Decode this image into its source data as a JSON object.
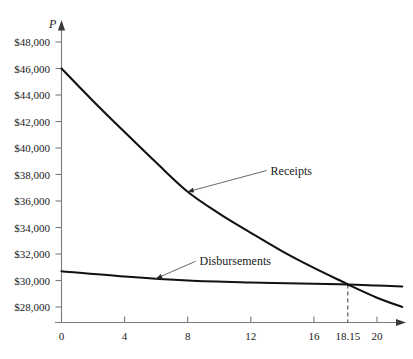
{
  "chart_data": {
    "type": "line",
    "title": "",
    "xlabel": "",
    "ylabel": "P",
    "ylabel_style": "italic",
    "xlim": [
      0,
      21.8
    ],
    "ylim": [
      27000,
      49000
    ],
    "grid": false,
    "legend": "inline-annotations",
    "x_ticks": [
      {
        "value": 0,
        "label": "0"
      },
      {
        "value": 4,
        "label": "4"
      },
      {
        "value": 8,
        "label": "8"
      },
      {
        "value": 12,
        "label": "12"
      },
      {
        "value": 16,
        "label": "16"
      },
      {
        "value": 18.15,
        "label": "18.15"
      },
      {
        "value": 20,
        "label": "20"
      }
    ],
    "y_ticks": [
      {
        "value": 48000,
        "label": "$48,000"
      },
      {
        "value": 46000,
        "label": "$46,000"
      },
      {
        "value": 44000,
        "label": "$44,000"
      },
      {
        "value": 42000,
        "label": "$42,000"
      },
      {
        "value": 40000,
        "label": "$40,000"
      },
      {
        "value": 38000,
        "label": "$38,000"
      },
      {
        "value": 36000,
        "label": "$36,000"
      },
      {
        "value": 34000,
        "label": "$34,000"
      },
      {
        "value": 32000,
        "label": "$32,000"
      },
      {
        "value": 30000,
        "label": "$30,000"
      },
      {
        "value": 28000,
        "label": "$28,000"
      }
    ],
    "series": [
      {
        "name": "Receipts",
        "color": "#111111",
        "x": [
          0,
          2,
          4,
          6,
          8,
          10,
          12,
          14,
          16,
          18,
          18.15,
          20,
          21.6
        ],
        "values": [
          46000,
          43550,
          41200,
          38900,
          36700,
          35050,
          33600,
          32200,
          30950,
          29800,
          29700,
          28700,
          28000
        ]
      },
      {
        "name": "Disbursements",
        "color": "#111111",
        "x": [
          0,
          4,
          8,
          12,
          16,
          18.15,
          20,
          21.6
        ],
        "values": [
          30700,
          30300,
          30000,
          29850,
          29750,
          29700,
          29620,
          29550
        ]
      }
    ],
    "annotations": [
      {
        "id": "receipts-annotation",
        "text": "Receipts",
        "label_x": 13.0,
        "label_y": 38300,
        "target_x": 8.0,
        "target_y": 36700
      },
      {
        "id": "disbursements-annotation",
        "text": "Disbursements",
        "label_x": 8.5,
        "label_y": 31450,
        "target_x": 6.0,
        "target_y": 30150
      }
    ],
    "markers": [
      {
        "id": "breakeven-dashed-line",
        "type": "vertical-dashed",
        "x": 18.15,
        "y_top": 29700,
        "label": "18.15"
      }
    ],
    "colors": {
      "axis": "#7a7a7a",
      "curve": "#111111",
      "leader": "#55555f",
      "text": "#1a1a1a",
      "background": "#ffffff"
    }
  }
}
